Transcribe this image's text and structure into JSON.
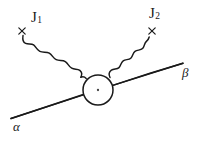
{
  "figure": {
    "kind": "feynman-diagram",
    "background_color": "#ffffff",
    "ink_color": "#1a1a1a",
    "width": 201,
    "height": 141
  },
  "labels": {
    "current_1": "J",
    "current_1_sub": "1",
    "current_2": "J",
    "current_2_sub": "2",
    "incoming_state": "α",
    "outgoing_state": "β"
  },
  "markers": {
    "cross_left": "×",
    "cross_right": "×"
  },
  "geometry": {
    "vertex_blob": {
      "cx": 98,
      "cy": 90,
      "r": 15
    },
    "center_dot": {
      "cx": 98,
      "cy": 90,
      "r": 1.1
    },
    "fermion_line": {
      "x1": 11,
      "y1": 118,
      "x2": 183,
      "y2": 63
    },
    "cross_left_pos": {
      "x": 22,
      "y": 31
    },
    "cross_right_pos": {
      "x": 152,
      "y": 31
    },
    "wave_left_start": {
      "x": 23,
      "y": 36
    },
    "wave_left_end": {
      "x": 86,
      "y": 78
    },
    "wave_right_start": {
      "x": 110,
      "y": 77
    },
    "wave_right_end": {
      "x": 149,
      "y": 37
    }
  }
}
